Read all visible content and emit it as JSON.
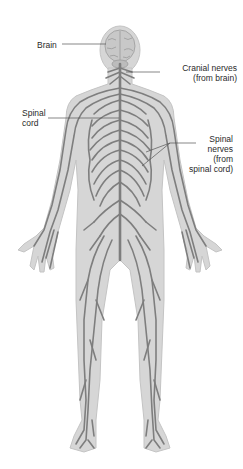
{
  "diagram": {
    "colors": {
      "background": "#ffffff",
      "body_fill": "#d6d6d6",
      "body_outline": "#c4c4c4",
      "nerve": "#7e7e7e",
      "leader_line": "#555555",
      "label_text": "#2a2a2a"
    },
    "labels": {
      "brain": {
        "lines": [
          "Brain"
        ]
      },
      "cranial_nerves": {
        "lines": [
          "Cranial nerves",
          "(from brain)"
        ]
      },
      "spinal_cord": {
        "lines": [
          "Spinal",
          "cord"
        ]
      },
      "spinal_nerves": {
        "lines": [
          "Spinal",
          "nerves",
          "(from",
          "spinal cord)"
        ]
      }
    }
  }
}
